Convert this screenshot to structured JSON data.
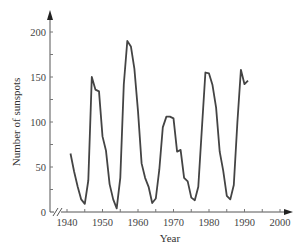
{
  "chart_data": {
    "type": "line",
    "title": "",
    "xlabel": "Year",
    "ylabel": "Number of sunspots",
    "xlim": [
      1937,
      2004
    ],
    "ylim": [
      0,
      210
    ],
    "x_ticks": [
      1940,
      1950,
      1960,
      1970,
      1980,
      1990,
      2000
    ],
    "x_tick_labels": [
      "1940",
      "1950",
      "1960",
      "1970",
      "1980",
      "1990",
      "2000"
    ],
    "y_ticks": [
      0,
      50,
      100,
      150,
      200
    ],
    "y_tick_labels": [
      "0",
      "50",
      "100",
      "150",
      "200"
    ],
    "axis_break": "x-axis break near origin",
    "grid": false,
    "legend": "none",
    "series": [
      {
        "name": "Sunspots",
        "color": "#444444",
        "x": [
          1941,
          1942,
          1943,
          1944,
          1945,
          1946,
          1947,
          1948,
          1949,
          1950,
          1951,
          1952,
          1953,
          1954,
          1955,
          1956,
          1957,
          1958,
          1959,
          1960,
          1961,
          1962,
          1963,
          1964,
          1965,
          1966,
          1967,
          1968,
          1969,
          1970,
          1971,
          1972,
          1973,
          1974,
          1975,
          1976,
          1977,
          1978,
          1979,
          1980,
          1981,
          1982,
          1983,
          1984,
          1985,
          1986,
          1987,
          1988,
          1989,
          1990,
          1991
        ],
        "values": [
          65,
          45,
          28,
          14,
          9,
          35,
          150,
          136,
          134,
          84,
          68,
          31,
          14,
          4,
          38,
          142,
          190,
          184,
          159,
          112,
          54,
          38,
          28,
          10,
          15,
          47,
          94,
          106,
          106,
          104,
          67,
          69,
          38,
          34,
          16,
          13,
          28,
          93,
          155,
          154,
          141,
          116,
          67,
          46,
          18,
          14,
          30,
          100,
          158,
          142,
          146
        ]
      }
    ]
  }
}
